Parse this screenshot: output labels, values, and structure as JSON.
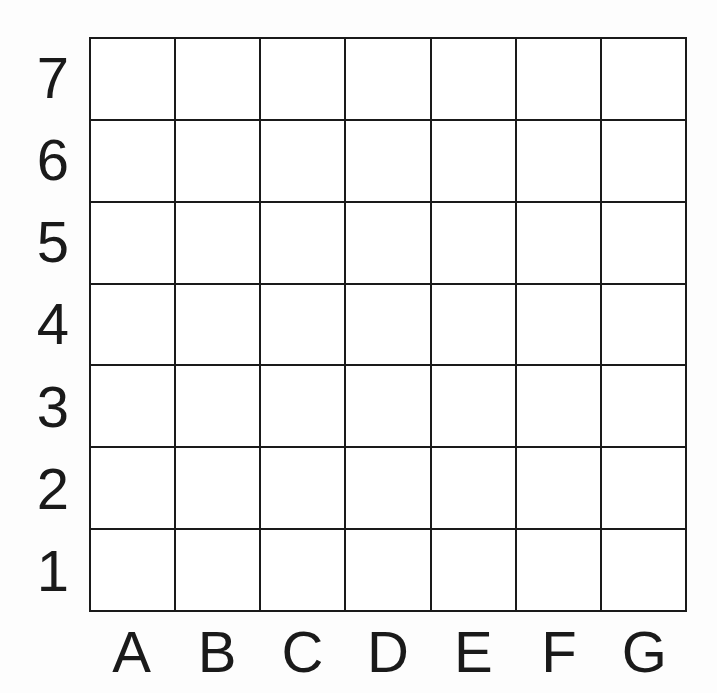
{
  "figure": {
    "kind": "coordinate-grid",
    "background_color": "#fdfdfd",
    "cell_fill_color": "#ffffff",
    "line_color": "#1a1a1a",
    "text_color": "#1a1a1a",
    "line_width_px": 2.5
  },
  "grid": {
    "columns": 7,
    "rows": 7,
    "column_labels": [
      "A",
      "B",
      "C",
      "D",
      "E",
      "F",
      "G"
    ],
    "row_labels_top_to_bottom": [
      "7",
      "6",
      "5",
      "4",
      "3",
      "2",
      "1"
    ],
    "cells": [
      [
        {
          "id": "A7",
          "value": ""
        },
        {
          "id": "B7",
          "value": ""
        },
        {
          "id": "C7",
          "value": ""
        },
        {
          "id": "D7",
          "value": ""
        },
        {
          "id": "E7",
          "value": ""
        },
        {
          "id": "F7",
          "value": ""
        },
        {
          "id": "G7",
          "value": ""
        }
      ],
      [
        {
          "id": "A6",
          "value": ""
        },
        {
          "id": "B6",
          "value": ""
        },
        {
          "id": "C6",
          "value": ""
        },
        {
          "id": "D6",
          "value": ""
        },
        {
          "id": "E6",
          "value": ""
        },
        {
          "id": "F6",
          "value": ""
        },
        {
          "id": "G6",
          "value": ""
        }
      ],
      [
        {
          "id": "A5",
          "value": ""
        },
        {
          "id": "B5",
          "value": ""
        },
        {
          "id": "C5",
          "value": ""
        },
        {
          "id": "D5",
          "value": ""
        },
        {
          "id": "E5",
          "value": ""
        },
        {
          "id": "F5",
          "value": ""
        },
        {
          "id": "G5",
          "value": ""
        }
      ],
      [
        {
          "id": "A4",
          "value": ""
        },
        {
          "id": "B4",
          "value": ""
        },
        {
          "id": "C4",
          "value": ""
        },
        {
          "id": "D4",
          "value": ""
        },
        {
          "id": "E4",
          "value": ""
        },
        {
          "id": "F4",
          "value": ""
        },
        {
          "id": "G4",
          "value": ""
        }
      ],
      [
        {
          "id": "A3",
          "value": ""
        },
        {
          "id": "B3",
          "value": ""
        },
        {
          "id": "C3",
          "value": ""
        },
        {
          "id": "D3",
          "value": ""
        },
        {
          "id": "E3",
          "value": ""
        },
        {
          "id": "F3",
          "value": ""
        },
        {
          "id": "G3",
          "value": ""
        }
      ],
      [
        {
          "id": "A2",
          "value": ""
        },
        {
          "id": "B2",
          "value": ""
        },
        {
          "id": "C2",
          "value": ""
        },
        {
          "id": "D2",
          "value": ""
        },
        {
          "id": "E2",
          "value": ""
        },
        {
          "id": "F2",
          "value": ""
        },
        {
          "id": "G2",
          "value": ""
        }
      ],
      [
        {
          "id": "A1",
          "value": ""
        },
        {
          "id": "B1",
          "value": ""
        },
        {
          "id": "C1",
          "value": ""
        },
        {
          "id": "D1",
          "value": ""
        },
        {
          "id": "E1",
          "value": ""
        },
        {
          "id": "F1",
          "value": ""
        },
        {
          "id": "G1",
          "value": ""
        }
      ]
    ]
  }
}
